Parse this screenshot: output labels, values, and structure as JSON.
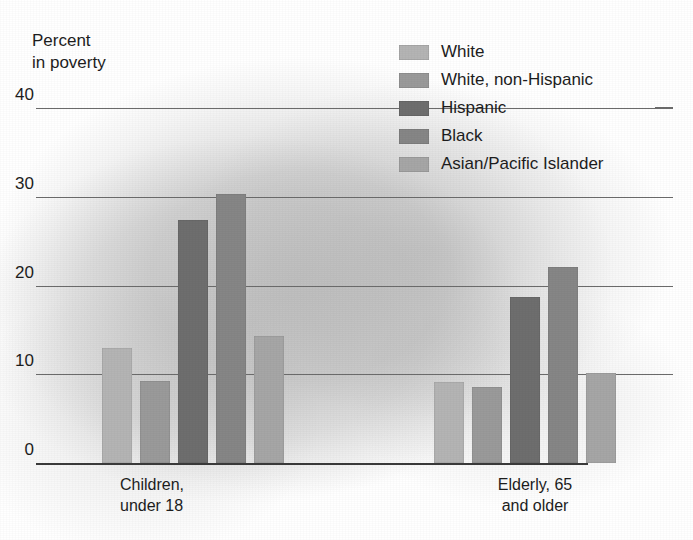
{
  "chart_data": {
    "type": "bar",
    "title": "",
    "subtitle": "",
    "ylabel": "Percent\nin poverty",
    "xlabel": "",
    "ylim": [
      0,
      40
    ],
    "yticks": [
      0,
      10,
      20,
      30,
      40
    ],
    "ytick_labels": [
      "0",
      "10",
      "20",
      "30",
      "40"
    ],
    "grid": true,
    "legend_position": "top-right",
    "categories": [
      "Children,\nunder 18",
      "Elderly, 65\nand older"
    ],
    "category_labels": [
      "Children, under 18",
      "Elderly, 65 and older"
    ],
    "series": [
      {
        "name": "White",
        "color": "#b4b4b4",
        "values": [
          13.0,
          9.1
        ]
      },
      {
        "name": "White, non-Hispanic",
        "color": "#9a9a9a",
        "values": [
          9.2,
          8.6
        ]
      },
      {
        "name": "Hispanic",
        "color": "#6e6e6e",
        "values": [
          27.4,
          18.7
        ]
      },
      {
        "name": "Black",
        "color": "#868686",
        "values": [
          30.3,
          22.1
        ]
      },
      {
        "name": "Asian/Pacific Islander",
        "color": "#a6a6a6",
        "values": [
          14.3,
          10.1
        ]
      }
    ]
  },
  "axis": {
    "y_title": "Percent\nin poverty",
    "tick_0": "0",
    "tick_10": "10",
    "tick_20": "20",
    "tick_30": "30",
    "tick_40": "40"
  },
  "xlabels": {
    "group_1": "Children,\nunder 18",
    "group_2": "Elderly, 65\nand older"
  },
  "legend": {
    "items": [
      {
        "label": "White"
      },
      {
        "label": "White, non-Hispanic"
      },
      {
        "label": "Hispanic"
      },
      {
        "label": "Black"
      },
      {
        "label": "Asian/Pacific Islander"
      }
    ]
  }
}
